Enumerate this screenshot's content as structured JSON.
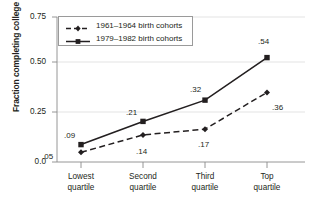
{
  "chart_data": {
    "type": "line",
    "title": "",
    "xlabel": "",
    "ylabel": "Fraction completing college",
    "categories": [
      "Lowest quartile",
      "Second quartile",
      "Third quartile",
      "Top quartile"
    ],
    "category_lines": [
      [
        "Lowest",
        "quartile"
      ],
      [
        "Second",
        "quartile"
      ],
      [
        "Third",
        "quartile"
      ],
      [
        "Top",
        "quartile"
      ]
    ],
    "ylim": [
      0.0,
      0.75
    ],
    "yticks": [
      0.0,
      0.25,
      0.5,
      0.75
    ],
    "ytick_labels": [
      "0.0",
      "0.25",
      "0.50",
      "0.75"
    ],
    "grid": true,
    "legend_position": "upper left",
    "series": [
      {
        "name": "1961–1964 birth cohorts",
        "values": [
          0.05,
          0.14,
          0.17,
          0.36
        ],
        "labels": [
          ".05",
          ".14",
          ".17",
          ".36"
        ],
        "line_style": "dashed",
        "marker": "diamond",
        "color": "#231f20"
      },
      {
        "name": "1979–1982 birth cohorts",
        "values": [
          0.09,
          0.21,
          0.32,
          0.54
        ],
        "labels": [
          ".09",
          ".21",
          ".32",
          ".54"
        ],
        "line_style": "solid",
        "marker": "square",
        "color": "#231f20"
      }
    ]
  },
  "colors": {
    "ink": "#231f20",
    "grid": "#d8d8d8",
    "axis": "#7a7a7a",
    "legend_border": "#9a9a9a",
    "background": "#ffffff"
  }
}
